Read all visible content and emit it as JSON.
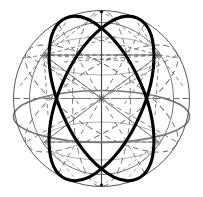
{
  "figure": {
    "title": "Sphere with great circles",
    "background_color": "#ffffff",
    "width": 203,
    "height": 197
  },
  "geometry": {
    "center": {
      "x": 101.5,
      "y": 98.5
    },
    "radius": 88,
    "pole_north": {
      "x": 101.5,
      "y": 10.5
    },
    "pole_south": {
      "x": 101.5,
      "y": 186.5
    },
    "equator_ry": 26,
    "equator_offset_y": 18,
    "vertex_upper_left": {
      "x": 44,
      "y": 55
    },
    "vertex_upper_right": {
      "x": 159,
      "y": 55
    },
    "vertex_lower_left": {
      "x": 44,
      "y": 142
    },
    "vertex_lower_right": {
      "x": 159,
      "y": 142
    }
  },
  "colors": {
    "bold_stroke": "#000000",
    "outline_stroke": "#555555",
    "equator_stroke": "#777777",
    "dashed_stroke": "#6b6b6b",
    "faint_stroke": "#9a9a9a",
    "axis_stroke": "#444444"
  },
  "strokes": {
    "bold_width": 3.1,
    "outline_width": 1.0,
    "equator_width": 1.6,
    "dashed_width": 0.9,
    "faint_width": 0.8,
    "axis_width": 1.1,
    "dash_pattern_long": "6 4",
    "dash_pattern_short": "3 3",
    "dash_pattern_fine": "2 3"
  },
  "elements": {
    "boundary_circle": "sphere-boundary-circle",
    "bold_great_circle_left": "bold-great-circle-left",
    "bold_great_circle_right": "bold-great-circle-right",
    "equator_ellipse": "equator-ellipse",
    "polar_axis": "polar-axis",
    "equator_chord": "equatorial-chord",
    "dashed_great_circle_vertical": "dashed-great-circle-vertical",
    "dashed_great_circle_tilted": "dashed-great-circle-tilted",
    "meridian_rays": "center-meridian-rays"
  },
  "labels": {
    "figure_caption": "",
    "alt": "Sphere great-circle construction diagram"
  }
}
